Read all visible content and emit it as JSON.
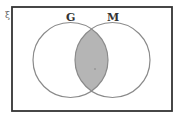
{
  "diagram": {
    "type": "venn",
    "universal_set_symbol": "ξ",
    "sets": [
      {
        "name": "G",
        "label": "G"
      },
      {
        "name": "M",
        "label": "M"
      }
    ],
    "shaded_region": "G ∩ M",
    "colors": {
      "border": "#333333",
      "circle_stroke": "#8a8a8a",
      "shade": "#b5b5b5",
      "background": "#ffffff"
    }
  }
}
